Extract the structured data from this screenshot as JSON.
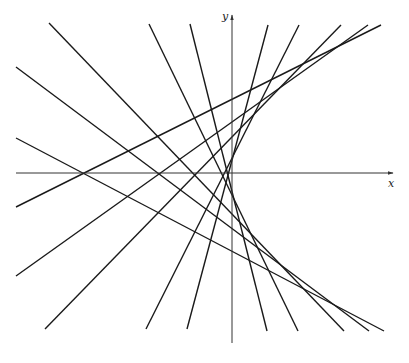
{
  "figure": {
    "title": "",
    "line_color": "#1a1a1a",
    "axis_color": "#333333",
    "axes": {
      "x_label": "x",
      "y_label": "y",
      "origin": [
        232,
        173
      ],
      "x_axis": {
        "x1": 16,
        "y1": 173,
        "x2": 393,
        "y2": 173
      },
      "y_axis": {
        "x1": 232,
        "y1": 343,
        "x2": 232,
        "y2": 15
      }
    },
    "tangent_lines": [
      {
        "x1": 16,
        "y1": 138,
        "x2": 384,
        "y2": 331
      },
      {
        "x1": 16,
        "y1": 207,
        "x2": 381,
        "y2": 25
      },
      {
        "x1": 16,
        "y1": 67,
        "x2": 369,
        "y2": 331
      },
      {
        "x1": 16,
        "y1": 276,
        "x2": 368,
        "y2": 25
      },
      {
        "x1": 49,
        "y1": 23,
        "x2": 344,
        "y2": 331
      },
      {
        "x1": 45,
        "y1": 329,
        "x2": 341,
        "y2": 25
      },
      {
        "x1": 149,
        "y1": 24,
        "x2": 298,
        "y2": 331
      },
      {
        "x1": 146,
        "y1": 329,
        "x2": 299,
        "y2": 25
      },
      {
        "x1": 190,
        "y1": 24,
        "x2": 267,
        "y2": 331
      },
      {
        "x1": 187,
        "y1": 329,
        "x2": 268,
        "y2": 25
      }
    ]
  }
}
